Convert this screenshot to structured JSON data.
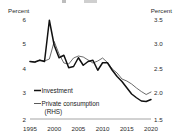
{
  "chart_data": {
    "type": "line",
    "title": "",
    "xlabel": "",
    "ylabel": "Percent",
    "ylabel_right": "Percent",
    "grid": false,
    "legend_position": "inside-left",
    "x": [
      1995,
      1996,
      1997,
      1998,
      1999,
      2000,
      2001,
      2002,
      2003,
      2004,
      2005,
      2006,
      2007,
      2008,
      2009,
      2010,
      2011,
      2012,
      2013,
      2014,
      2015,
      2016,
      2017,
      2018,
      2019,
      2020
    ],
    "xlim": [
      1995,
      2020
    ],
    "xticks": [
      1995,
      2000,
      2005,
      2010,
      2015,
      2020
    ],
    "xtick_labels": [
      "1995",
      "2000",
      "2005",
      "2010",
      "2015",
      "2020"
    ],
    "ylim": [
      2,
      6
    ],
    "yticks": [
      2,
      3,
      4,
      5,
      6
    ],
    "ytick_labels": [
      "2",
      "3",
      "4",
      "5",
      "6"
    ],
    "ylim_right": [
      1.5,
      3.5
    ],
    "yticks_right": [
      1.5,
      2.0,
      2.5,
      3.0,
      3.5
    ],
    "ytick_labels_right": [
      "1.5",
      "2.0",
      "2.5",
      "3.0",
      "3.5"
    ],
    "series": [
      {
        "name": "Investment",
        "axis": "left",
        "color": "#111111",
        "width": 1.5,
        "values": [
          4.3,
          4.28,
          4.35,
          4.3,
          5.95,
          4.95,
          4.45,
          4.55,
          4.05,
          4.1,
          4.45,
          4.15,
          4.3,
          4.35,
          3.95,
          4.25,
          4.25,
          3.95,
          3.7,
          3.5,
          3.25,
          3.0,
          2.85,
          2.72,
          2.7,
          2.78
        ]
      },
      {
        "name": "Private consumption (RHS)",
        "axis": "right",
        "color": "#5a5a5a",
        "width": 0.9,
        "values": [
          2.65,
          2.63,
          2.68,
          2.66,
          2.7,
          3.05,
          2.8,
          2.62,
          2.6,
          2.72,
          2.76,
          2.74,
          2.68,
          2.62,
          2.66,
          2.72,
          2.63,
          2.5,
          2.42,
          2.3,
          2.26,
          2.2,
          2.12,
          2.05,
          1.99,
          2.04
        ]
      }
    ]
  },
  "axes": {
    "left_unit": "Percent",
    "right_unit": "Percent"
  },
  "legend": {
    "items": [
      {
        "label": "Investment",
        "color": "#111111"
      },
      {
        "label": "Private consumption",
        "color": "#5a5a5a"
      },
      {
        "label": "(RHS)",
        "color": "#5a5a5a"
      }
    ]
  }
}
